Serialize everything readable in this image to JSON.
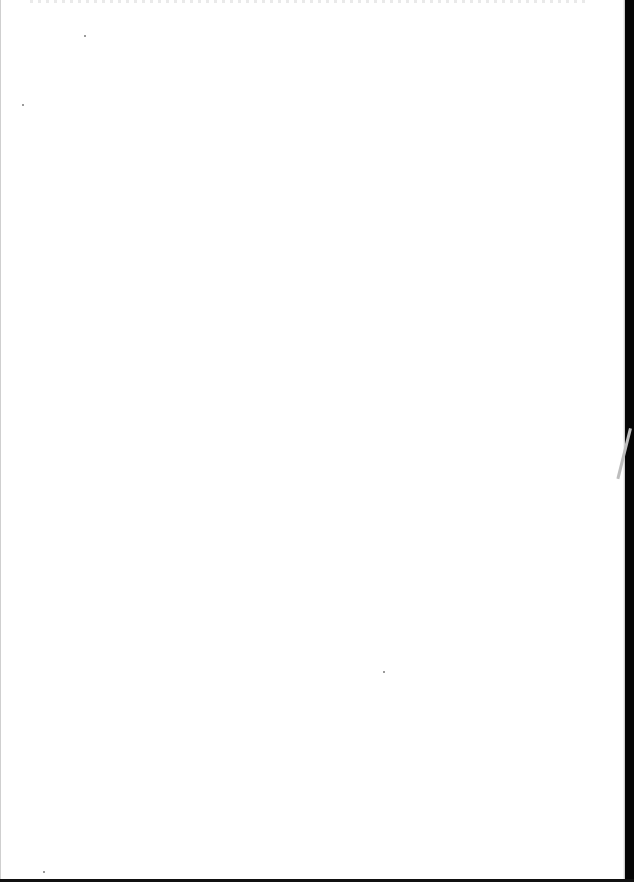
{
  "document": {
    "type": "scanned-page",
    "content": "blank",
    "background_color": "#ffffff",
    "edge_color": "#050505"
  },
  "artifacts": {
    "specks": [
      {
        "x": 84,
        "y": 35
      },
      {
        "x": 22,
        "y": 104
      },
      {
        "x": 383,
        "y": 671
      },
      {
        "x": 43,
        "y": 871
      }
    ]
  }
}
